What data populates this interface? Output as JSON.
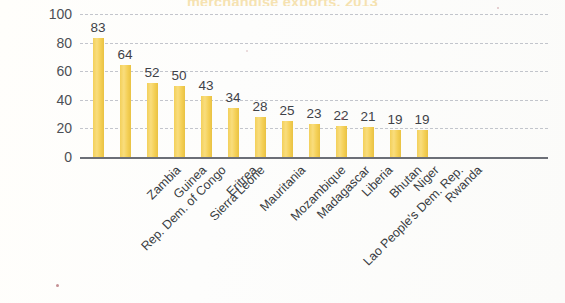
{
  "chart_data": {
    "type": "bar",
    "title": "merchandise exports, 2013",
    "xlabel": "",
    "ylabel": "",
    "ylim": [
      0,
      100
    ],
    "yticks": [
      100,
      80,
      60,
      40,
      20,
      0
    ],
    "grid": true,
    "legend": "none",
    "bar_color": "#F4D157",
    "categories": [
      "Rep. Dem. of Congo",
      "Zambia",
      "Guinea",
      "Sierra Leone",
      "Eritrea",
      "Mauritania",
      "Mozambique",
      "Madagascar",
      "Lao People's Dem. Rep.",
      "Liberia",
      "Bhutan",
      "Niger",
      "Rwanda"
    ],
    "values": [
      83,
      64,
      52,
      50,
      43,
      34,
      28,
      25,
      23,
      22,
      21,
      19,
      19
    ],
    "data_labels": [
      "83",
      "64",
      "52",
      "50",
      "43",
      "34",
      "28",
      "25",
      "23",
      "22",
      "21",
      "19",
      "19"
    ]
  }
}
